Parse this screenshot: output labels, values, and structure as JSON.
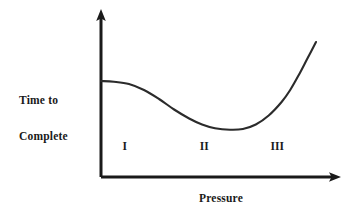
{
  "figure": {
    "background_color": "#ffffff",
    "ink_color": "#1a1a1a"
  },
  "chart_data": {
    "type": "line",
    "title": "",
    "subtitle": "",
    "xlabel": "Pressure",
    "ylabel": "Time to\nComplete",
    "ylabel_lines": [
      "Time to",
      "Complete"
    ],
    "grid": false,
    "legend": null,
    "axis_ticks": {
      "x": [],
      "y": []
    },
    "axis_style": "arrow-headed open axes, no tick marks, no numeric scale",
    "xlim": [
      0,
      1
    ],
    "ylim": [
      0,
      1
    ],
    "series": [
      {
        "name": "Time to Complete vs Pressure",
        "shape": "decreasing then flat minimum then sharply increasing (U / J shaped)",
        "x": [
          0.0,
          0.06,
          0.13,
          0.2,
          0.27,
          0.34,
          0.41,
          0.47,
          0.53,
          0.6,
          0.66,
          0.72,
          0.78,
          0.84,
          0.88,
          0.92,
          0.96,
          1.0
        ],
        "y": [
          0.64,
          0.635,
          0.62,
          0.58,
          0.52,
          0.45,
          0.39,
          0.35,
          0.325,
          0.315,
          0.32,
          0.35,
          0.41,
          0.5,
          0.58,
          0.68,
          0.79,
          0.9
        ]
      }
    ],
    "annotations": [
      {
        "label": "I",
        "x": 0.11,
        "y": 0.205,
        "meaning": "region-1"
      },
      {
        "label": "II",
        "x": 0.48,
        "y": 0.205,
        "meaning": "region-2"
      },
      {
        "label": "III",
        "x": 0.82,
        "y": 0.205,
        "meaning": "region-3"
      }
    ],
    "regions": [
      "I",
      "II",
      "III"
    ]
  },
  "axes": {
    "x_axis_label": "Pressure",
    "y_axis_label_line1": "Time to",
    "y_axis_label_line2": "Complete"
  }
}
